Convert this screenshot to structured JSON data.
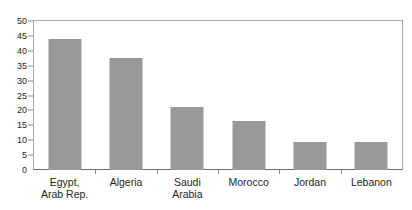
{
  "chart_data": {
    "type": "bar",
    "title": "",
    "subtitle": "",
    "xlabel": "",
    "ylabel": "",
    "ylim": [
      0,
      50
    ],
    "yticks": [
      0,
      5,
      10,
      15,
      20,
      25,
      30,
      35,
      40,
      45,
      50
    ],
    "grid": false,
    "legend": false,
    "bar_color": "#999999",
    "axis_color": "#8c8c8c",
    "categories": [
      "Egypt,\nArab Rep.",
      "Algeria",
      "Saudi\nArabia",
      "Morocco",
      "Jordan",
      "Lebanon"
    ],
    "category_lines": [
      [
        "Egypt,",
        "Arab Rep."
      ],
      [
        "Algeria"
      ],
      [
        "Saudi",
        "Arabia"
      ],
      [
        "Morocco"
      ],
      [
        "Jordan"
      ],
      [
        "Lebanon"
      ]
    ],
    "values": [
      44,
      37.5,
      21,
      16.5,
      9.3,
      9.3
    ]
  },
  "axis": {
    "y_tick_labels": [
      "50",
      "45",
      "40",
      "35",
      "30",
      "25",
      "20",
      "15",
      "10",
      "5",
      "0"
    ]
  }
}
